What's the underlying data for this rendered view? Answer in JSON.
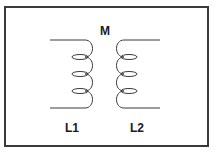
{
  "diagram": {
    "labels": {
      "mutual": "M",
      "left_inductor": "L1",
      "right_inductor": "L2"
    },
    "coils": [
      {
        "name": "L1",
        "side": "left",
        "turns": 3,
        "leads": [
          "top",
          "bottom"
        ],
        "lead_direction": "left"
      },
      {
        "name": "L2",
        "side": "right",
        "turns": 3,
        "leads": [
          "top",
          "bottom"
        ],
        "lead_direction": "right"
      }
    ],
    "colors": {
      "stroke": "#3a3a3a",
      "text": "#1a1a1a",
      "background": "#ffffff"
    }
  }
}
